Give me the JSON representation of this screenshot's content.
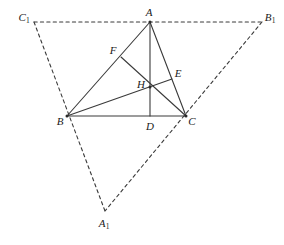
{
  "figure": {
    "type": "geometry-diagram",
    "background_color": "#ffffff",
    "stroke_color": "#3a3a3a",
    "label_color": "#1a1a1a",
    "solid_stroke_width": 1.1,
    "dashed_stroke_width": 1.1,
    "dash_pattern": "3,3"
  },
  "points": [
    {
      "id": "A",
      "label": "A",
      "sub": "",
      "x": 150,
      "y": 22,
      "label_x": 149,
      "label_y": 12,
      "marked": true
    },
    {
      "id": "B",
      "label": "B",
      "sub": "",
      "x": 67,
      "y": 116,
      "label_x": 60,
      "label_y": 121,
      "marked": true
    },
    {
      "id": "C",
      "label": "C",
      "sub": "",
      "x": 186,
      "y": 116,
      "label_x": 192,
      "label_y": 121,
      "marked": true
    },
    {
      "id": "D",
      "label": "D",
      "sub": "",
      "x": 150,
      "y": 116,
      "label_x": 150,
      "label_y": 126,
      "marked": false
    },
    {
      "id": "E",
      "label": "E",
      "sub": "",
      "x": 172,
      "y": 79,
      "label_x": 178,
      "label_y": 73,
      "marked": false
    },
    {
      "id": "F",
      "label": "F",
      "sub": "",
      "x": 121,
      "y": 57,
      "label_x": 113,
      "label_y": 50,
      "marked": false
    },
    {
      "id": "H",
      "label": "H",
      "sub": "",
      "x": 150,
      "y": 87,
      "label_x": 141,
      "label_y": 84,
      "marked": true
    },
    {
      "id": "A1",
      "label": "A",
      "sub": "1",
      "x": 105,
      "y": 211,
      "label_x": 104,
      "label_y": 223,
      "marked": false
    },
    {
      "id": "B1",
      "label": "B",
      "sub": "1",
      "x": 262,
      "y": 22,
      "label_x": 270,
      "label_y": 17,
      "marked": false
    },
    {
      "id": "C1",
      "label": "C",
      "sub": "1",
      "x": 34,
      "y": 22,
      "label_x": 24,
      "label_y": 17,
      "marked": false
    }
  ],
  "segments": [
    {
      "id": "side-AB",
      "from": "A",
      "to": "B",
      "style": "solid",
      "note": "triangle side AB"
    },
    {
      "id": "side-BC",
      "from": "B",
      "to": "C",
      "style": "solid",
      "note": "triangle side BC"
    },
    {
      "id": "side-CA",
      "from": "C",
      "to": "A",
      "style": "solid",
      "note": "triangle side CA"
    },
    {
      "id": "altitude-AD",
      "from": "A",
      "to": "D",
      "style": "solid",
      "note": "altitude from A to BC at D"
    },
    {
      "id": "cevian-BE",
      "from": "B",
      "to": "E",
      "style": "solid",
      "note": "altitude from B to CA at E"
    },
    {
      "id": "cevian-CF",
      "from": "C",
      "to": "F",
      "style": "solid",
      "note": "altitude from C to AB at F"
    },
    {
      "id": "outer-C1B1",
      "from": "C1",
      "to": "B1",
      "style": "dashed",
      "note": "outer triangle top side through A"
    },
    {
      "id": "outer-C1A1",
      "from": "C1",
      "to": "A1",
      "style": "dashed",
      "note": "outer triangle left side through B"
    },
    {
      "id": "outer-B1A1",
      "from": "B1",
      "to": "A1",
      "style": "dashed",
      "note": "outer triangle right side through C"
    }
  ],
  "labels": {
    "A": "A",
    "B": "B",
    "C": "C",
    "D": "D",
    "E": "E",
    "F": "F",
    "H": "H",
    "A1_base": "A",
    "A1_sub": "1",
    "B1_base": "B",
    "B1_sub": "1",
    "C1_base": "C",
    "C1_sub": "1"
  }
}
